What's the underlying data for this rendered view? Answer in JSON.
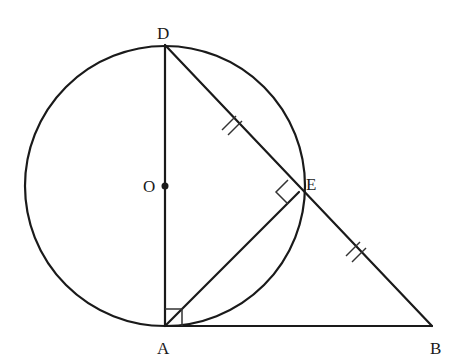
{
  "diagram": {
    "type": "geometry",
    "points": {
      "D": {
        "label": "D",
        "x": 165,
        "y": 45
      },
      "O": {
        "label": "O",
        "x": 165,
        "y": 186
      },
      "A": {
        "label": "A",
        "x": 165,
        "y": 326
      },
      "E": {
        "label": "E",
        "x": 299,
        "y": 192
      },
      "B": {
        "label": "B",
        "x": 432,
        "y": 326
      }
    },
    "circle": {
      "center": "O",
      "radius": 140
    },
    "segments": [
      "DA",
      "DB",
      "AE",
      "AB"
    ],
    "marks": {
      "right_angles": [
        "A (between DA and AB)",
        "E (between DE and AE)"
      ],
      "equal_ticks": [
        "DE",
        "EB"
      ]
    },
    "colors": {
      "stroke": "#1a1a1a",
      "background": "#ffffff"
    }
  }
}
